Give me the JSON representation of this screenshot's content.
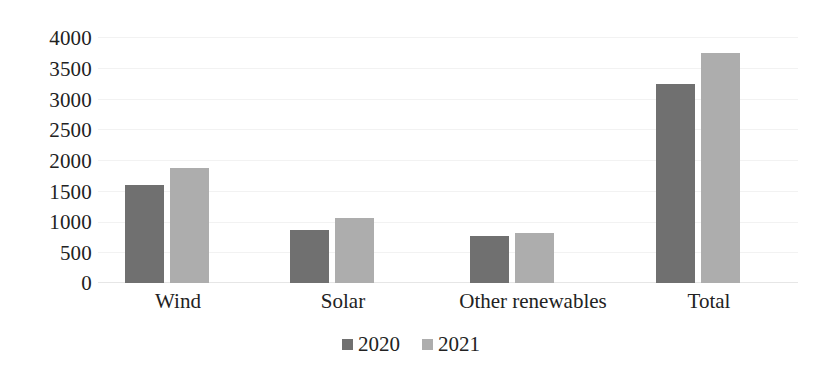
{
  "chart_data": {
    "type": "bar",
    "title": "",
    "subtitle": "",
    "xlabel": "",
    "ylabel": "",
    "categories": [
      "Wind",
      "Solar",
      "Other renewables",
      "Total"
    ],
    "series": [
      {
        "name": "2020",
        "color": "#707070",
        "values": [
          1600,
          870,
          760,
          3230
        ]
      },
      {
        "name": "2021",
        "color": "#adadad",
        "values": [
          1870,
          1050,
          820,
          3740
        ]
      }
    ],
    "ylim": [
      0,
      4000
    ],
    "y_ticks": [
      4000,
      3500,
      3000,
      2500,
      2000,
      1500,
      1000,
      500,
      0
    ],
    "y_tick_labels": [
      "4000",
      "3500",
      "3000",
      "2500",
      "2000",
      "1500",
      "1000",
      "500",
      "0"
    ],
    "grid": true,
    "grid_axis": "y",
    "legend": {
      "position": "bottom",
      "entries": [
        {
          "label": "2020",
          "color": "#707070"
        },
        {
          "label": "2021",
          "color": "#adadad"
        }
      ]
    },
    "background_color": "#ffffff",
    "axis_text_color": "#222222"
  }
}
